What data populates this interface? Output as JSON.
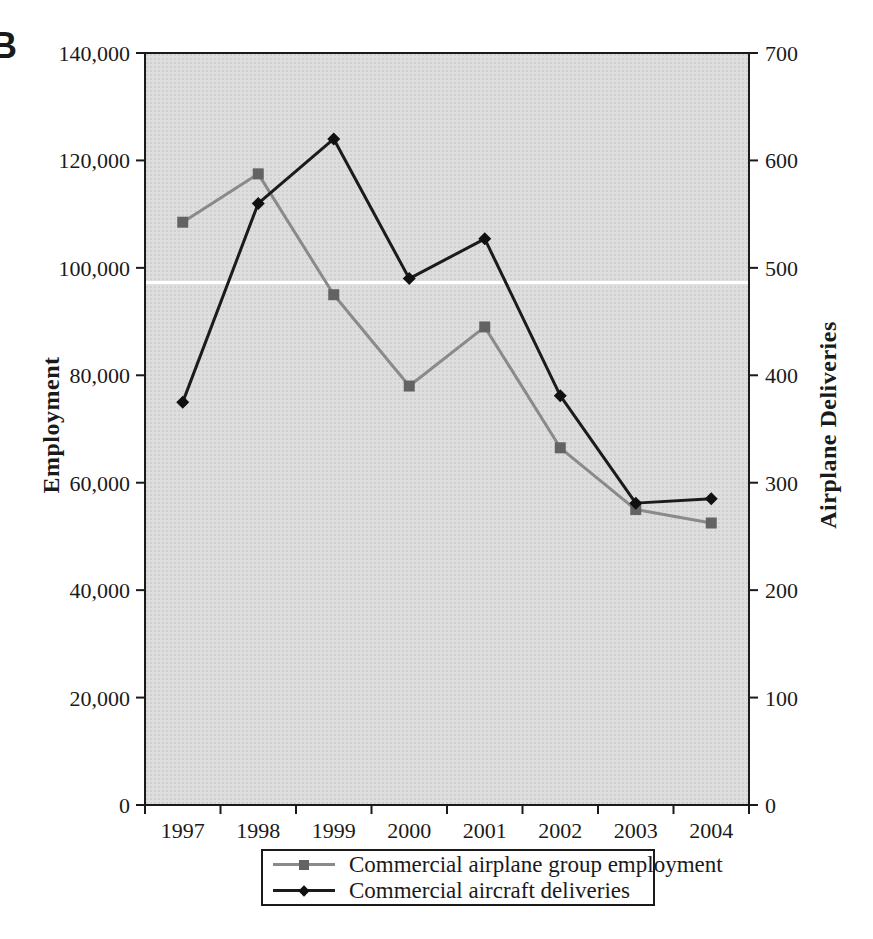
{
  "panel_label": "B",
  "chart_data": {
    "type": "line",
    "title": "",
    "x": [
      "1997",
      "1998",
      "1999",
      "2000",
      "2001",
      "2002",
      "2003",
      "2004"
    ],
    "series": [
      {
        "name": "Commercial airplane group employment",
        "axis": "left",
        "marker": "square",
        "line_color": "#8a8a8a",
        "marker_color": "#636363",
        "values": [
          108500,
          117500,
          95000,
          78000,
          89000,
          66500,
          55000,
          52500
        ]
      },
      {
        "name": "Commercial aircraft deliveries",
        "axis": "right",
        "marker": "diamond",
        "line_color": "#1b1b1b",
        "marker_color": "#101010",
        "values": [
          375,
          560,
          620,
          490,
          527,
          381,
          281,
          285
        ]
      }
    ],
    "left_axis": {
      "label": "Employment",
      "min": 0,
      "max": 140000,
      "tick_step": 20000,
      "tick_labels": [
        "0",
        "20,000",
        "40,000",
        "60,000",
        "80,000",
        "100,000",
        "120,000",
        "140,000"
      ]
    },
    "right_axis": {
      "label": "Airplane Deliveries",
      "min": 0,
      "max": 700,
      "tick_step": 100,
      "tick_labels": [
        "0",
        "100",
        "200",
        "300",
        "400",
        "500",
        "600",
        "700"
      ]
    },
    "legend_position": "bottom",
    "grid": "off",
    "plot_background": "#dedede",
    "frame_color": "#1a1a1a",
    "white_gridline_left_value": 97200
  }
}
